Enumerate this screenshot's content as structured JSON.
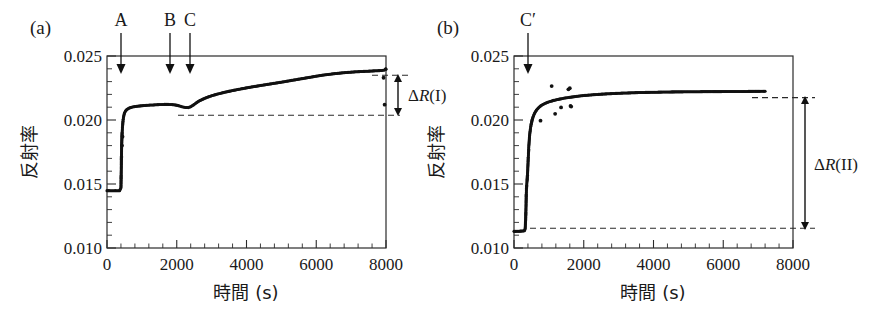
{
  "figure": {
    "panels": [
      {
        "id": "a",
        "panel_label": "(a)",
        "xlabel": "時間 (s)",
        "ylabel": "反射率",
        "xticklabels": [
          "0",
          "2000",
          "4000",
          "6000",
          "8000"
        ],
        "yticklabels": [
          "0.010",
          "0.015",
          "0.020",
          "0.025"
        ],
        "markers": [
          {
            "label": "A",
            "x": 420
          },
          {
            "label": "B",
            "x": 1800
          },
          {
            "label": "C",
            "x": 2350
          }
        ],
        "annotation": {
          "label": "ΔR(I)",
          "delta": "Δ",
          "symbol": "R",
          "roman": "(I)",
          "from": 0.0209,
          "to": 0.024
        },
        "reference_line": 0.0209
      },
      {
        "id": "b",
        "panel_label": "(b)",
        "xlabel": "時間 (s)",
        "ylabel": "反射率",
        "xticklabels": [
          "0",
          "2000",
          "4000",
          "6000",
          "8000"
        ],
        "yticklabels": [
          "0.010",
          "0.015",
          "0.020",
          "0.025"
        ],
        "markers": [
          {
            "label": "C′",
            "x": 340
          }
        ],
        "annotation": {
          "label": "ΔR(II)",
          "delta": "Δ",
          "symbol": "R",
          "roman": "(II)",
          "from": 0.0113,
          "to": 0.0223
        },
        "reference_line_low": 0.0113,
        "reference_line_high": 0.0223
      }
    ]
  },
  "chart_data": [
    {
      "type": "scatter",
      "panel": "a",
      "title": "(a)",
      "xlabel": "時間 (s)",
      "ylabel": "反射率",
      "xlim": [
        0,
        8000
      ],
      "ylim": [
        0.01,
        0.025
      ],
      "xticks": [
        0,
        2000,
        4000,
        6000,
        8000
      ],
      "yticks": [
        0.01,
        0.015,
        0.02,
        0.025
      ],
      "grid": false,
      "legend": null,
      "annotations": [
        {
          "text": "A",
          "x": 420,
          "kind": "down-arrow"
        },
        {
          "text": "B",
          "x": 1800,
          "kind": "down-arrow"
        },
        {
          "text": "C",
          "x": 2350,
          "kind": "down-arrow"
        },
        {
          "text": "ΔR(I)",
          "from_y": 0.0209,
          "to_y": 0.024,
          "kind": "double-arrow"
        },
        {
          "text": "",
          "y": 0.0209,
          "kind": "dashed-hline"
        }
      ],
      "x": [
        0,
        60,
        120,
        180,
        240,
        300,
        360,
        400,
        420,
        430,
        440,
        450,
        460,
        470,
        480,
        495,
        510,
        530,
        560,
        600,
        650,
        700,
        760,
        820,
        900,
        980,
        1060,
        1150,
        1250,
        1350,
        1450,
        1550,
        1650,
        1750,
        1850,
        1950,
        2050,
        2150,
        2250,
        2330,
        2400,
        2480,
        2560,
        2650,
        2750,
        2850,
        2960,
        3080,
        3200,
        3330,
        3460,
        3600,
        3740,
        3880,
        4020,
        4160,
        4300,
        4450,
        4600,
        4750,
        4900,
        5050,
        5200,
        5350,
        5500,
        5650,
        5800,
        5950,
        6100,
        6250,
        6400,
        6550,
        6700,
        6850,
        7000,
        7150,
        7300,
        7450,
        7600,
        7750,
        7880,
        7950,
        7980,
        7990,
        7995,
        8000
      ],
      "y": [
        0.01448,
        0.01448,
        0.01447,
        0.01447,
        0.01448,
        0.01447,
        0.01448,
        0.0147,
        0.018,
        0.0188,
        0.0193,
        0.01965,
        0.01995,
        0.02015,
        0.02032,
        0.02048,
        0.0206,
        0.0207,
        0.0208,
        0.02088,
        0.02095,
        0.02099,
        0.02103,
        0.02106,
        0.02109,
        0.02111,
        0.02113,
        0.02115,
        0.02117,
        0.02118,
        0.0212,
        0.02121,
        0.02122,
        0.02122,
        0.02121,
        0.02118,
        0.02112,
        0.02104,
        0.02098,
        0.02097,
        0.02104,
        0.02118,
        0.02134,
        0.0215,
        0.02163,
        0.02175,
        0.02186,
        0.02196,
        0.02205,
        0.02214,
        0.02222,
        0.0223,
        0.02238,
        0.02245,
        0.02252,
        0.02259,
        0.02265,
        0.02272,
        0.02278,
        0.02285,
        0.02291,
        0.02298,
        0.02305,
        0.02312,
        0.02319,
        0.02326,
        0.02333,
        0.0234,
        0.02347,
        0.02353,
        0.02358,
        0.02363,
        0.02367,
        0.02371,
        0.02374,
        0.02377,
        0.02379,
        0.02381,
        0.02383,
        0.02385,
        0.02387,
        0.0239,
        0.02395,
        0.024,
        0.02398,
        0.02396
      ],
      "outliers_x": [
        430,
        445,
        7930,
        7960
      ],
      "outliers_y": [
        0.018,
        0.0187,
        0.0233,
        0.0212
      ],
      "baseline_value": 0.01448,
      "plateau_1_value": 0.0212,
      "final_value": 0.024
    },
    {
      "type": "scatter",
      "panel": "b",
      "title": "(b)",
      "xlabel": "時間 (s)",
      "ylabel": "反射率",
      "xlim": [
        0,
        8000
      ],
      "ylim": [
        0.01,
        0.025
      ],
      "xticks": [
        0,
        2000,
        4000,
        6000,
        8000
      ],
      "yticks": [
        0.01,
        0.015,
        0.02,
        0.025
      ],
      "grid": false,
      "legend": null,
      "annotations": [
        {
          "text": "C′",
          "x": 340,
          "kind": "down-arrow"
        },
        {
          "text": "ΔR(II)",
          "from_y": 0.0113,
          "to_y": 0.0223,
          "kind": "double-arrow"
        },
        {
          "text": "",
          "y": 0.0113,
          "kind": "dashed-hline"
        },
        {
          "text": "",
          "y": 0.0223,
          "kind": "dashed-hline"
        }
      ],
      "x": [
        0,
        50,
        100,
        150,
        200,
        250,
        300,
        320,
        335,
        345,
        352,
        358,
        364,
        370,
        376,
        382,
        388,
        394,
        400,
        408,
        416,
        424,
        434,
        444,
        456,
        470,
        486,
        504,
        524,
        548,
        574,
        604,
        638,
        676,
        718,
        764,
        814,
        868,
        926,
        990,
        1060,
        1135,
        1215,
        1300,
        1390,
        1485,
        1585,
        1690,
        1800,
        1915,
        2035,
        2160,
        2290,
        2425,
        2565,
        2710,
        2860,
        3015,
        3175,
        3340,
        3510,
        3685,
        3865,
        4050,
        4240,
        4435,
        4635,
        4840,
        5050,
        5265,
        5485,
        5710,
        5940,
        6175,
        6415,
        6660,
        6910,
        7050,
        7150,
        7200
      ],
      "y": [
        0.0113,
        0.0113,
        0.01131,
        0.01131,
        0.01132,
        0.01133,
        0.01135,
        0.0115,
        0.0123,
        0.0133,
        0.0142,
        0.01465,
        0.0149,
        0.0151,
        0.0153,
        0.01552,
        0.01578,
        0.0161,
        0.0165,
        0.017,
        0.01745,
        0.0179,
        0.0183,
        0.01868,
        0.019,
        0.0193,
        0.01958,
        0.01983,
        0.02005,
        0.02025,
        0.02043,
        0.0206,
        0.02075,
        0.02088,
        0.021,
        0.0211,
        0.02119,
        0.02127,
        0.02134,
        0.02141,
        0.02147,
        0.02153,
        0.02158,
        0.02163,
        0.02168,
        0.02173,
        0.02177,
        0.02181,
        0.02185,
        0.02189,
        0.02192,
        0.02195,
        0.02198,
        0.022,
        0.02203,
        0.02205,
        0.02207,
        0.02209,
        0.02211,
        0.02212,
        0.02214,
        0.02215,
        0.02216,
        0.02217,
        0.02218,
        0.02219,
        0.0222,
        0.0222,
        0.02221,
        0.02221,
        0.02222,
        0.02222,
        0.02222,
        0.02223,
        0.02223,
        0.02223,
        0.02224,
        0.02224,
        0.02225,
        0.02225
      ],
      "outliers_x": [
        760,
        1080,
        1180,
        1350,
        1560,
        1600,
        1620,
        1640
      ],
      "outliers_y": [
        0.01995,
        0.02265,
        0.02048,
        0.02098,
        0.0224,
        0.02248,
        0.0211,
        0.02105
      ],
      "baseline_value": 0.0113,
      "plateau_value": 0.02225
    }
  ]
}
